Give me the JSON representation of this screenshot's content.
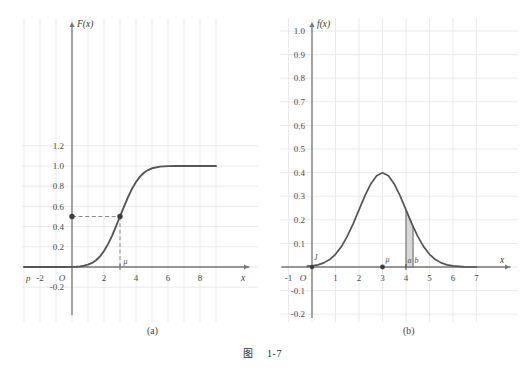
{
  "figure": {
    "caption_label": "图",
    "caption_number": "1-7",
    "panel_a_label": "(a)",
    "panel_b_label": "(b)"
  },
  "style": {
    "curve_color": "#555555",
    "grid_color": "#e9e9ee",
    "axis_color": "#777777",
    "dash_color": "#8a8a8a",
    "dot_color": "#3d3d3d",
    "shade_fill": "#c9c9c9",
    "text_color": "#3a3a3a"
  },
  "panel_a": {
    "name": "(a)",
    "y_axis_label": "F(x)",
    "x_axis_label": "x",
    "origin_label": "O",
    "left_edge_label": "p",
    "x_ticks": [
      "-2",
      "2",
      "4",
      "6",
      "8"
    ],
    "x_tick_values": [
      -2,
      2,
      4,
      6,
      8
    ],
    "y_ticks": [
      "1.2",
      "1.0",
      "0.8",
      "0.6",
      "0.4",
      "0.2",
      "-0.2"
    ],
    "y_tick_values": [
      1.2,
      1.0,
      0.8,
      0.6,
      0.4,
      0.2,
      -0.2
    ],
    "mu_label": "μ",
    "markers": [
      {
        "name": "y-axis-dot",
        "x": 0,
        "y": 0.5
      },
      {
        "name": "curve-dot",
        "x": 3,
        "y": 0.5
      }
    ],
    "guide_lines": [
      {
        "name": "horizontal-guide",
        "from": [
          0,
          0.5
        ],
        "to": [
          3,
          0.5
        ]
      },
      {
        "name": "vertical-guide",
        "from": [
          3,
          0.5
        ],
        "to": [
          3,
          0
        ]
      }
    ]
  },
  "panel_b": {
    "name": "(b)",
    "y_axis_label": "f(x)",
    "x_axis_label": "x",
    "origin_label": "O",
    "curve_start_label": "J",
    "x_ticks": [
      "-1",
      "1",
      "2",
      "3",
      "4",
      "5",
      "6",
      "7"
    ],
    "x_tick_values": [
      -1,
      1,
      2,
      3,
      4,
      5,
      6,
      7
    ],
    "y_ticks": [
      "1.0",
      "0.9",
      "0.8",
      "0.7",
      "0.6",
      "0.5",
      "0.4",
      "0.3",
      "0.2",
      "0.1",
      "-0.1",
      "-0.2"
    ],
    "y_tick_values": [
      1.0,
      0.9,
      0.8,
      0.7,
      0.6,
      0.5,
      0.4,
      0.3,
      0.2,
      0.1,
      -0.1,
      -0.2
    ],
    "mu_label": "μ",
    "a_label": "a",
    "b_label": "b",
    "markers": [
      {
        "name": "mu-dot",
        "x": 3,
        "y": 0
      },
      {
        "name": "origin-dot",
        "x": 0,
        "y": 0
      }
    ],
    "shaded_region": {
      "from_x": 4.0,
      "to_x": 4.3,
      "name": "probability-area"
    }
  },
  "chart_data": [
    {
      "type": "line",
      "id": "panel-a-cdf",
      "title": "",
      "xlabel": "x",
      "ylabel": "F(x)",
      "xlim": [
        -3.2,
        9.4
      ],
      "ylim": [
        -0.32,
        1.34
      ],
      "grid": true,
      "legend": null,
      "xticks": [
        -2,
        2,
        4,
        6,
        8
      ],
      "xticklabels": [
        "-2",
        "2",
        "4",
        "6",
        "8"
      ],
      "yticks": [
        -0.2,
        0.2,
        0.4,
        0.6,
        0.8,
        1.0,
        1.2
      ],
      "yticklabels": [
        "-0.2",
        "0.2",
        "0.4",
        "0.6",
        "0.8",
        "1.0",
        "1.2"
      ],
      "description": "Normal cumulative distribution function with mean 3 and standard deviation 1",
      "series": [
        {
          "name": "F(x)",
          "x": [
            -3.0,
            -2.5,
            -2.0,
            -1.5,
            -1.0,
            -0.5,
            0.0,
            0.25,
            0.5,
            0.75,
            1.0,
            1.25,
            1.5,
            1.75,
            2.0,
            2.25,
            2.5,
            2.75,
            3.0,
            3.25,
            3.5,
            3.75,
            4.0,
            4.25,
            4.5,
            4.75,
            5.0,
            5.5,
            6.0,
            6.5,
            7.0,
            7.5,
            8.0,
            8.5,
            9.0
          ],
          "y": [
            0.0,
            0.0,
            0.0,
            0.0,
            0.0,
            0.0002,
            0.0013,
            0.003,
            0.0062,
            0.0122,
            0.0228,
            0.0401,
            0.0668,
            0.1056,
            0.1587,
            0.2266,
            0.3085,
            0.4013,
            0.5,
            0.5987,
            0.6915,
            0.7734,
            0.8413,
            0.8944,
            0.9332,
            0.9599,
            0.9772,
            0.9938,
            0.9987,
            0.9998,
            1.0,
            1.0,
            1.0,
            1.0,
            1.0
          ]
        }
      ],
      "annotations": [
        {
          "type": "point",
          "x": 0,
          "y": 0.5,
          "label": ""
        },
        {
          "type": "point",
          "x": 3,
          "y": 0.5,
          "label": ""
        },
        {
          "type": "dashed-line",
          "from": [
            0,
            0.5
          ],
          "to": [
            3,
            0.5
          ]
        },
        {
          "type": "dashed-line",
          "from": [
            3,
            0.5
          ],
          "to": [
            3,
            0
          ]
        },
        {
          "type": "text",
          "x": 3,
          "y": 0,
          "label": "μ"
        }
      ]
    },
    {
      "type": "line",
      "id": "panel-b-pdf",
      "title": "",
      "xlabel": "x",
      "ylabel": "f(x)",
      "xlim": [
        -1.5,
        7.8
      ],
      "ylim": [
        -0.28,
        1.12
      ],
      "grid": true,
      "legend": null,
      "xticks": [
        -1,
        1,
        2,
        3,
        4,
        5,
        6,
        7
      ],
      "xticklabels": [
        "-1",
        "1",
        "2",
        "3",
        "4",
        "5",
        "6",
        "7"
      ],
      "yticks": [
        -0.2,
        -0.1,
        0.1,
        0.2,
        0.3,
        0.4,
        0.5,
        0.6,
        0.7,
        0.8,
        0.9,
        1.0
      ],
      "yticklabels": [
        "-0.2",
        "-0.1",
        "0.1",
        "0.2",
        "0.3",
        "0.4",
        "0.5",
        "0.6",
        "0.7",
        "0.8",
        "0.9",
        "1.0"
      ],
      "description": "Normal probability density function with mean 3 and standard deviation 1, peak value 0.3989, with shaded area between a=4 and b=4.3",
      "series": [
        {
          "name": "f(x)",
          "x": [
            -0.2,
            0.0,
            0.25,
            0.5,
            0.75,
            1.0,
            1.25,
            1.5,
            1.75,
            2.0,
            2.25,
            2.5,
            2.75,
            3.0,
            3.25,
            3.5,
            3.75,
            4.0,
            4.25,
            4.5,
            4.75,
            5.0,
            5.25,
            5.5,
            5.75,
            6.0,
            6.5,
            7.0
          ],
          "y": [
            0.0038,
            0.0044,
            0.0088,
            0.0175,
            0.0317,
            0.054,
            0.0863,
            0.1295,
            0.1826,
            0.242,
            0.3011,
            0.3521,
            0.3867,
            0.3989,
            0.3867,
            0.3521,
            0.3011,
            0.242,
            0.1826,
            0.1295,
            0.0863,
            0.054,
            0.0317,
            0.0175,
            0.0088,
            0.0044,
            0.0009,
            0.0001
          ]
        }
      ],
      "annotations": [
        {
          "type": "shaded-area",
          "from_x": 4.0,
          "to_x": 4.3,
          "label": "P(a<X<b)"
        },
        {
          "type": "point",
          "x": 3,
          "y": 0,
          "label": "μ"
        },
        {
          "type": "text",
          "x": 4.0,
          "y": 0.03,
          "label": "a"
        },
        {
          "type": "text",
          "x": 4.35,
          "y": 0.03,
          "label": "b"
        },
        {
          "type": "text",
          "x": 0.05,
          "y": 0.06,
          "label": "J"
        }
      ]
    }
  ]
}
